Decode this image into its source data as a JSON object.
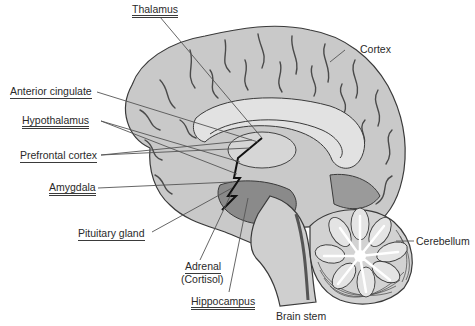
{
  "diagram": {
    "type": "anatomical-illustration",
    "labels": {
      "thalamus": "Thalamus",
      "cortex": "Cortex",
      "anterior_cingulate": "Anterior cingulate",
      "hypothalamus": "Hypothalamus",
      "prefrontal_cortex": "Prefrontal cortex",
      "amygdala": "Amygdala",
      "pituitary_gland": "Pituitary gland",
      "adrenal": "Adrenal",
      "adrenal_note": "(Cortisol)",
      "hippocampus": "Hippocampus",
      "brain_stem": "Brain stem",
      "cerebellum": "Cerebellum"
    },
    "colors": {
      "cortex_fill": "#c9c9c9",
      "inner_fill": "#dcdcdc",
      "dark_region": "#8a8a8a",
      "outline": "#3a3a3a",
      "leader_line": "#555555",
      "pathway": "#111111"
    }
  }
}
